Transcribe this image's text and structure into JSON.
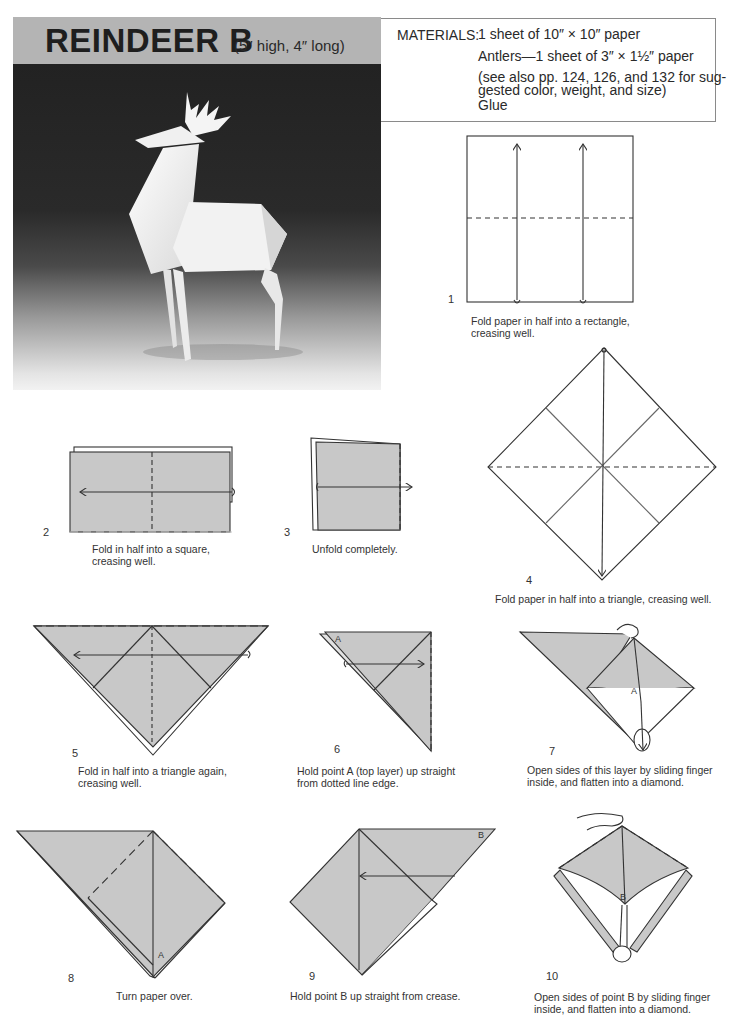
{
  "header": {
    "title": "REINDEER B",
    "dimensions": "(5″ high, 4″ long)"
  },
  "photo": {
    "subject": "white origami reindeer on dark gradient background"
  },
  "materials": {
    "label": "MATERIALS:",
    "lines": [
      "1 sheet of 10″ × 10″ paper",
      "Antlers—1 sheet of 3″ × 1½″ paper",
      "(see also pp. 124, 126, and 132 for sug-",
      "gested color, weight, and size)",
      "Glue"
    ]
  },
  "steps": [
    {
      "number": "1",
      "caption_lines": [
        "Fold paper in half into a rectangle,",
        "creasing well."
      ]
    },
    {
      "number": "2",
      "caption_lines": [
        "Fold in half into a square,",
        "creasing well."
      ]
    },
    {
      "number": "3",
      "caption_lines": [
        "Unfold completely."
      ]
    },
    {
      "number": "4",
      "caption_lines": [
        "Fold paper in half into a triangle, creasing well."
      ]
    },
    {
      "number": "5",
      "caption_lines": [
        "Fold in half into a triangle again,",
        "creasing well."
      ]
    },
    {
      "number": "6",
      "caption_lines": [
        "Hold point A (top layer) up straight",
        "from dotted line edge."
      ],
      "labels": [
        "A"
      ]
    },
    {
      "number": "7",
      "caption_lines": [
        "Open sides of this layer by sliding finger",
        "inside, and flatten into a diamond."
      ],
      "labels": [
        "A"
      ]
    },
    {
      "number": "8",
      "caption_lines": [
        "Turn paper over."
      ],
      "labels": [
        "A"
      ]
    },
    {
      "number": "9",
      "caption_lines": [
        "Hold point B up straight from crease."
      ],
      "labels": [
        "B"
      ]
    },
    {
      "number": "10",
      "caption_lines": [
        "Open sides of point B by sliding finger",
        "inside, and flatten into a diamond."
      ],
      "labels": [
        "B"
      ]
    }
  ],
  "colors": {
    "paper_fill": "#c8c8c8",
    "banner": "#b4b4b4",
    "line": "#333333"
  }
}
